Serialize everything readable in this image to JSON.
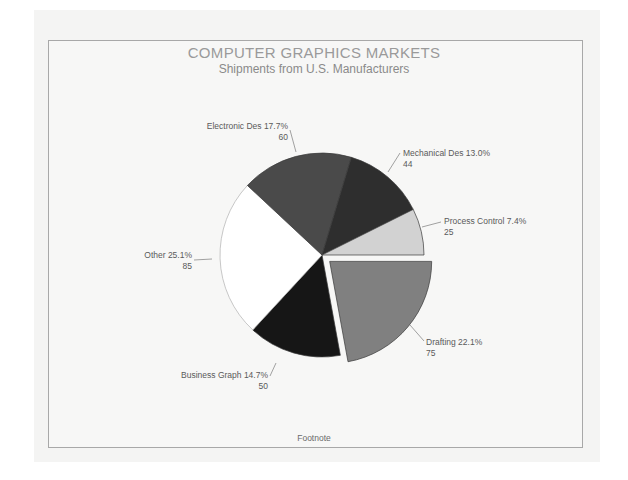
{
  "chart_data": {
    "type": "pie",
    "title": "COMPUTER GRAPHICS MARKETS",
    "subtitle": "Shipments from U.S. Manufacturers",
    "footnote": "Footnote",
    "total": 339,
    "slices": [
      {
        "label": "Drafting",
        "value": 75,
        "percent": "22.1%",
        "color": "#808080",
        "exploded": true
      },
      {
        "label": "Business Graph",
        "value": 50,
        "percent": "14.7%",
        "color": "#161616",
        "exploded": false
      },
      {
        "label": "Other",
        "value": 85,
        "percent": "25.1%",
        "color": "#ffffff",
        "exploded": false
      },
      {
        "label": "Electronic Des",
        "value": 60,
        "percent": "17.7%",
        "color": "#4a4a4a",
        "exploded": false
      },
      {
        "label": "Mechanical Des",
        "value": 44,
        "percent": "13.0%",
        "color": "#2e2e2e",
        "exploded": false
      },
      {
        "label": "Process Control",
        "value": 25,
        "percent": "7.4%",
        "color": "#d2d2d2",
        "exploded": false
      }
    ],
    "legend": "none (direct labels)"
  },
  "labels": {
    "electronic": {
      "name": "Electronic Des 17.7%",
      "value": "60"
    },
    "mechanical": {
      "name": "Mechanical Des 13.0%",
      "value": "44"
    },
    "process": {
      "name": "Process Control 7.4%",
      "value": "25"
    },
    "other": {
      "name": "Other 25.1%",
      "value": "85"
    },
    "drafting": {
      "name": "Drafting 22.1%",
      "value": "75"
    },
    "business": {
      "name": "Business Graph 14.7%",
      "value": "50"
    }
  }
}
